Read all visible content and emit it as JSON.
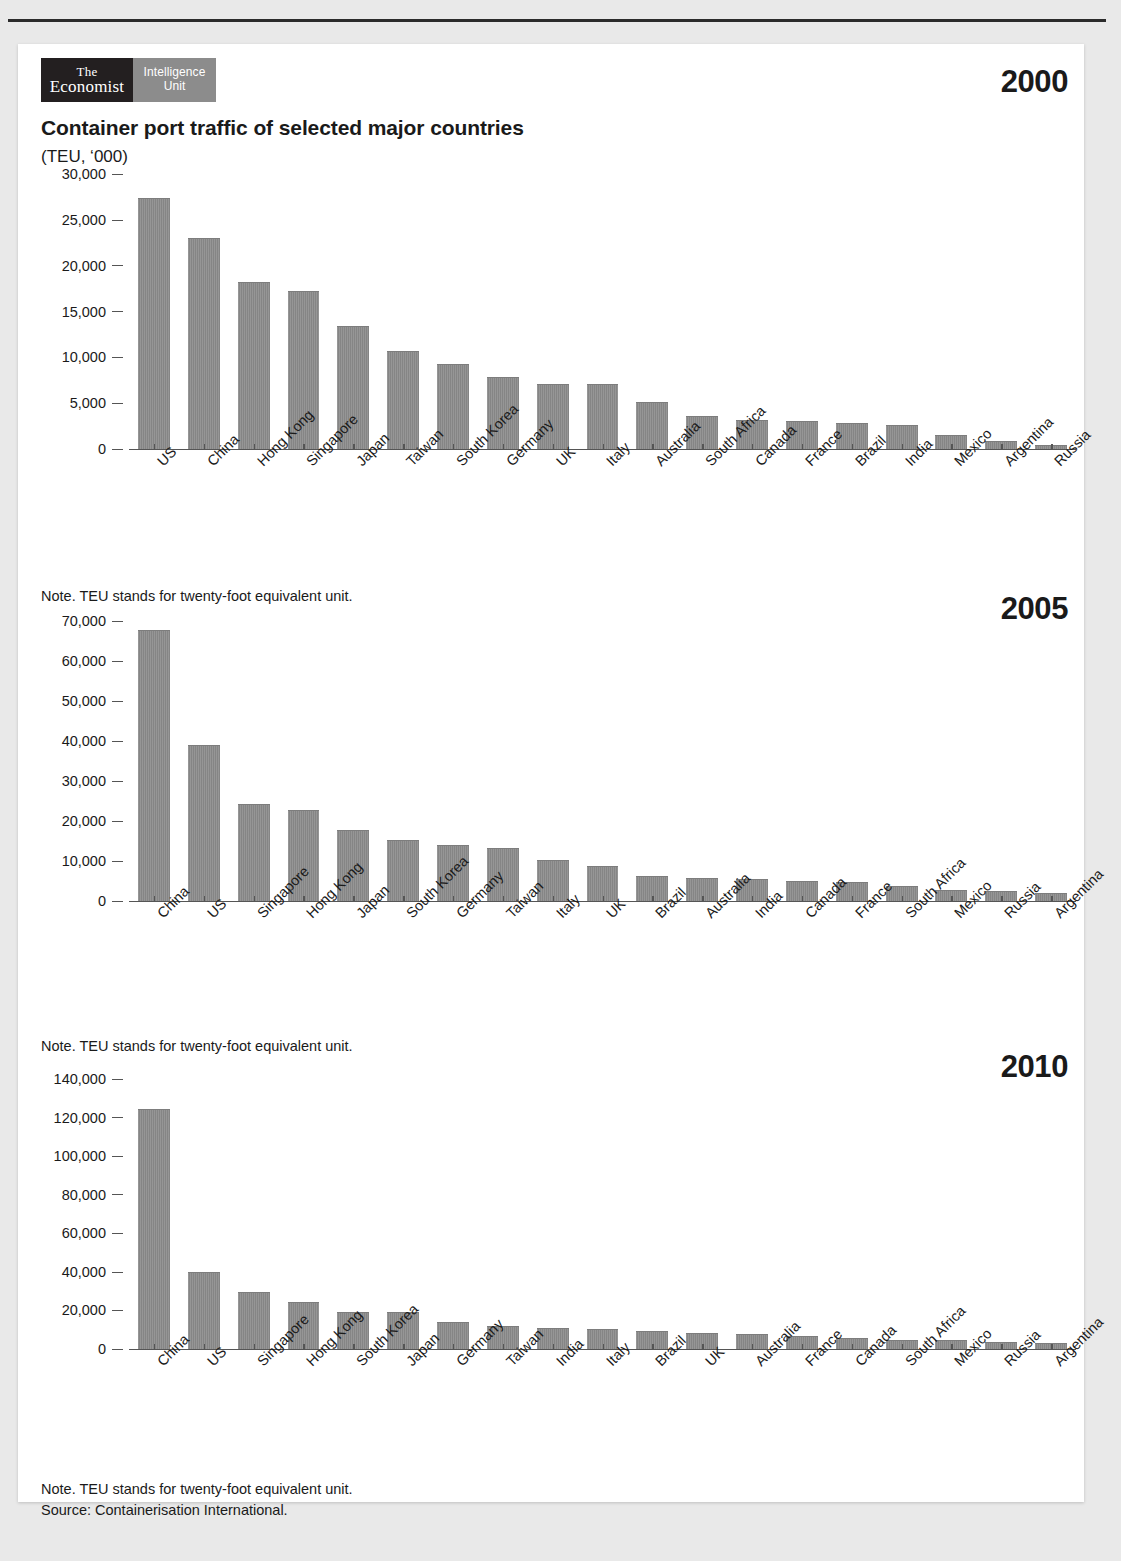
{
  "brand": {
    "line1": "The",
    "line2": "Economist",
    "line3": "Intelligence",
    "line4": "Unit"
  },
  "header": {
    "title": "Container port traffic of selected major countries",
    "units": "(TEU, ‘000)"
  },
  "years": {
    "y2000": "2000",
    "y2005": "2005",
    "y2010": "2010"
  },
  "notes": {
    "teu": "Note. TEU stands for twenty-foot equivalent unit.",
    "source": "Source: Containerisation International."
  },
  "colors": {
    "bar": "#8a8a8a",
    "axis": "#555555",
    "logo_black": "#231f20",
    "logo_grey": "#8c8c8c",
    "page": "#e9e9e9",
    "sheet": "#ffffff"
  },
  "chart_data": [
    {
      "type": "bar",
      "title": "Container port traffic of selected major countries",
      "subtitle": "2000",
      "xlabel": "",
      "ylabel": "(TEU, '000)",
      "ylim": [
        0,
        30000
      ],
      "yticks": [
        0,
        5000,
        10000,
        15000,
        20000,
        25000,
        30000
      ],
      "ytick_labels": [
        "0",
        "5,000",
        "10,000",
        "15,000",
        "20,000",
        "25,000",
        "30,000"
      ],
      "grid": false,
      "legend": "none",
      "note": "Note. TEU stands for twenty-foot equivalent unit.",
      "categories": [
        "US",
        "China",
        "Hong Kong",
        "Singapore",
        "Japan",
        "Taiwan",
        "South Korea",
        "Germany",
        "UK",
        "Italy",
        "Australia",
        "South Africa",
        "Canada",
        "France",
        "Brazil",
        "India",
        "Mexico",
        "Argentina",
        "Russia"
      ],
      "values": [
        27300,
        22900,
        18100,
        17100,
        13300,
        10600,
        9200,
        7800,
        7000,
        7000,
        5000,
        3500,
        3050,
        3000,
        2700,
        2500,
        1400,
        800,
        300
      ]
    },
    {
      "type": "bar",
      "title": "Container port traffic of selected major countries",
      "subtitle": "2005",
      "xlabel": "",
      "ylabel": "(TEU, '000)",
      "ylim": [
        0,
        70000
      ],
      "yticks": [
        0,
        10000,
        20000,
        30000,
        40000,
        50000,
        60000,
        70000
      ],
      "ytick_labels": [
        "0",
        "10,000",
        "20,000",
        "30,000",
        "40,000",
        "50,000",
        "60,000",
        "70,000"
      ],
      "grid": false,
      "legend": "none",
      "note": "Note. TEU stands for twenty-foot equivalent unit.",
      "categories": [
        "China",
        "US",
        "Singapore",
        "Hong Kong",
        "Japan",
        "South Korea",
        "Germany",
        "Taiwan",
        "Italy",
        "UK",
        "Brazil",
        "Australia",
        "India",
        "Canada",
        "France",
        "South Africa",
        "Mexico",
        "Russia",
        "Argentina"
      ],
      "values": [
        67500,
        38800,
        24100,
        22600,
        17400,
        15000,
        13700,
        12900,
        10000,
        8600,
        5900,
        5600,
        5300,
        4700,
        4500,
        3600,
        2400,
        2200,
        1800
      ]
    },
    {
      "type": "bar",
      "title": "Container port traffic of selected major countries",
      "subtitle": "2010",
      "xlabel": "",
      "ylabel": "(TEU, '000)",
      "ylim": [
        0,
        140000
      ],
      "yticks": [
        0,
        20000,
        40000,
        60000,
        80000,
        100000,
        120000,
        140000
      ],
      "ytick_labels": [
        "0",
        "20,000",
        "40,000",
        "60,000",
        "80,000",
        "100,000",
        "120,000",
        "140,000"
      ],
      "grid": false,
      "legend": "none",
      "note": "Note. TEU stands for twenty-foot equivalent unit.",
      "source": "Source: Containerisation International.",
      "categories": [
        "China",
        "US",
        "Singapore",
        "Hong Kong",
        "South Korea",
        "Japan",
        "Germany",
        "Taiwan",
        "India",
        "Italy",
        "Brazil",
        "UK",
        "Australia",
        "France",
        "Canada",
        "South Africa",
        "Mexico",
        "Russia",
        "Argentina"
      ],
      "values": [
        124000,
        39500,
        29200,
        23700,
        18800,
        18700,
        13500,
        11600,
        10300,
        10100,
        8700,
        7700,
        7100,
        6000,
        5100,
        4300,
        4000,
        3300,
        2400
      ]
    }
  ]
}
